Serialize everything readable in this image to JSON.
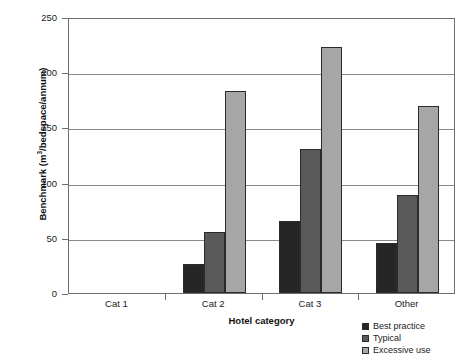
{
  "top_caption": "",
  "chart_data": {
    "type": "bar",
    "title": "",
    "xlabel": "Hotel category",
    "ylabel": "Benchmark (m3/bedspace/annum)",
    "ylabel_prefix": "Benchmark (m",
    "ylabel_sup": "3",
    "ylabel_suffix": "/bedspace/annum)",
    "categories": [
      "Cat 1",
      "Cat 2",
      "Cat 3",
      "Other"
    ],
    "series": [
      {
        "name": "Best practice",
        "color": "#262626",
        "values": [
          null,
          26,
          65,
          45
        ]
      },
      {
        "name": "Typical",
        "color": "#595959",
        "values": [
          null,
          55,
          130,
          89
        ]
      },
      {
        "name": "Excessive use",
        "color": "#a6a6a6",
        "values": [
          null,
          183,
          223,
          169
        ]
      }
    ],
    "ylim": [
      0,
      250
    ],
    "yticks": [
      0,
      50,
      100,
      150,
      200,
      250
    ],
    "ytick_labels": [
      "0",
      "50",
      "100",
      "150",
      "200",
      "250"
    ],
    "grid": true,
    "legend_position": "bottom-right"
  },
  "legend": {
    "items": [
      {
        "label": "Best practice"
      },
      {
        "label": "Typical"
      },
      {
        "label": "Excessive use"
      }
    ]
  }
}
